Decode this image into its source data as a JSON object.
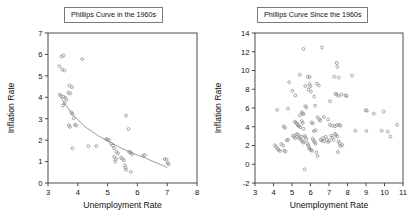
{
  "figure": {
    "background": "#ffffff",
    "marker_color": "#8a8a8a",
    "axis_color": "#3a3a3a",
    "curve_color": "#8a8a8a"
  },
  "panels": [
    {
      "id": "left",
      "title": "Phillips Curve in the 1960s",
      "chart_data": {
        "type": "scatter",
        "title": "Phillips Curve in the 1960s",
        "xlabel": "Unemployment Rate",
        "ylabel": "Inflation Rate",
        "xlim": [
          3,
          8
        ],
        "ylim": [
          0,
          7
        ],
        "xticks": [
          3,
          4,
          5,
          6,
          7,
          8
        ],
        "yticks": [
          0,
          1,
          2,
          3,
          4,
          5,
          6,
          7
        ],
        "grid": false,
        "legend": "none",
        "marker": "open-circle",
        "points": [
          [
            3.45,
            5.9
          ],
          [
            3.52,
            5.95
          ],
          [
            3.38,
            5.45
          ],
          [
            3.48,
            5.3
          ],
          [
            3.55,
            5.25
          ],
          [
            4.15,
            5.78
          ],
          [
            3.72,
            4.55
          ],
          [
            3.8,
            4.48
          ],
          [
            3.68,
            4.22
          ],
          [
            3.75,
            4.18
          ],
          [
            3.4,
            4.12
          ],
          [
            3.44,
            4.05
          ],
          [
            3.52,
            4.02
          ],
          [
            3.58,
            3.98
          ],
          [
            3.62,
            3.88
          ],
          [
            3.55,
            3.72
          ],
          [
            3.5,
            3.62
          ],
          [
            3.78,
            3.3
          ],
          [
            3.82,
            3.22
          ],
          [
            3.86,
            3.02
          ],
          [
            3.7,
            2.7
          ],
          [
            3.74,
            2.62
          ],
          [
            3.9,
            2.72
          ],
          [
            3.95,
            2.68
          ],
          [
            3.82,
            1.62
          ],
          [
            4.35,
            1.72
          ],
          [
            4.62,
            1.72
          ],
          [
            4.95,
            2.05
          ],
          [
            5.0,
            2.02
          ],
          [
            5.05,
            1.98
          ],
          [
            5.12,
            1.82
          ],
          [
            5.18,
            1.75
          ],
          [
            5.22,
            1.62
          ],
          [
            5.3,
            1.45
          ],
          [
            5.35,
            1.38
          ],
          [
            5.22,
            1.22
          ],
          [
            5.28,
            1.12
          ],
          [
            5.25,
            1.0
          ],
          [
            5.45,
            1.18
          ],
          [
            5.5,
            1.12
          ],
          [
            5.55,
            1.05
          ],
          [
            5.58,
            0.82
          ],
          [
            5.6,
            0.72
          ],
          [
            5.62,
            0.62
          ],
          [
            5.72,
            1.45
          ],
          [
            5.78,
            1.42
          ],
          [
            5.82,
            1.35
          ],
          [
            5.78,
            0.52
          ],
          [
            5.62,
            3.15
          ],
          [
            5.7,
            2.52
          ],
          [
            6.18,
            1.28
          ],
          [
            6.25,
            1.3
          ],
          [
            6.92,
            1.12
          ],
          [
            6.98,
            1.08
          ],
          [
            7.02,
            0.92
          ],
          [
            7.05,
            0.88
          ]
        ],
        "fit_curve": {
          "label": "fitted Phillips curve",
          "points": [
            [
              3.45,
              3.95
            ],
            [
              3.6,
              3.62
            ],
            [
              3.8,
              3.25
            ],
            [
              4.0,
              2.95
            ],
            [
              4.25,
              2.62
            ],
            [
              4.5,
              2.38
            ],
            [
              4.75,
              2.15
            ],
            [
              5.0,
              1.98
            ],
            [
              5.25,
              1.78
            ],
            [
              5.5,
              1.6
            ],
            [
              5.75,
              1.45
            ],
            [
              6.0,
              1.3
            ],
            [
              6.25,
              1.18
            ],
            [
              6.5,
              1.02
            ],
            [
              6.75,
              0.88
            ],
            [
              7.0,
              0.72
            ]
          ]
        }
      }
    },
    {
      "id": "right",
      "title": "Phillips Curve Since the 1960s",
      "chart_data": {
        "type": "scatter",
        "title": "Phillips Curve Since the 1960s",
        "xlabel": "Unemployment Rate",
        "ylabel": "Inflation Rate",
        "xlim": [
          3,
          11
        ],
        "ylim": [
          -2,
          14
        ],
        "xticks": [
          3,
          4,
          5,
          6,
          7,
          8,
          9,
          10,
          11
        ],
        "yticks": [
          -2,
          0,
          2,
          4,
          6,
          8,
          10,
          12,
          14
        ],
        "grid": false,
        "legend": "none",
        "marker": "open-circle",
        "points": [
          [
            5.62,
            12.3
          ],
          [
            6.62,
            12.45
          ],
          [
            7.42,
            10.8
          ],
          [
            7.45,
            10.4
          ],
          [
            5.42,
            9.55
          ],
          [
            5.85,
            9.35
          ],
          [
            5.95,
            9.3
          ],
          [
            7.28,
            9.35
          ],
          [
            7.52,
            9.25
          ],
          [
            8.25,
            9.45
          ],
          [
            4.85,
            8.75
          ],
          [
            5.72,
            8.35
          ],
          [
            5.95,
            8.55
          ],
          [
            5.98,
            8.3
          ],
          [
            6.45,
            8.4
          ],
          [
            6.35,
            8.6
          ],
          [
            5.02,
            7.82
          ],
          [
            5.18,
            7.35
          ],
          [
            5.9,
            7.95
          ],
          [
            6.02,
            7.75
          ],
          [
            7.35,
            7.52
          ],
          [
            7.42,
            7.45
          ],
          [
            7.52,
            7.3
          ],
          [
            7.68,
            7.42
          ],
          [
            7.9,
            7.35
          ],
          [
            7.95,
            7.28
          ],
          [
            7.05,
            6.72
          ],
          [
            6.2,
            7.22
          ],
          [
            6.25,
            6.25
          ],
          [
            4.2,
            5.8
          ],
          [
            4.78,
            5.95
          ],
          [
            5.52,
            5.55
          ],
          [
            5.58,
            5.42
          ],
          [
            5.62,
            5.35
          ],
          [
            5.72,
            6.2
          ],
          [
            5.78,
            6.05
          ],
          [
            5.42,
            5.2
          ],
          [
            6.38,
            5.02
          ],
          [
            6.48,
            4.82
          ],
          [
            6.52,
            4.65
          ],
          [
            6.72,
            5.05
          ],
          [
            6.95,
            4.78
          ],
          [
            8.98,
            5.75
          ],
          [
            9.05,
            5.72
          ],
          [
            9.42,
            5.4
          ],
          [
            9.95,
            5.62
          ],
          [
            4.55,
            4.05
          ],
          [
            4.62,
            3.88
          ],
          [
            5.15,
            4.55
          ],
          [
            5.22,
            4.42
          ],
          [
            5.28,
            4.3
          ],
          [
            5.32,
            4.15
          ],
          [
            5.38,
            4.08
          ],
          [
            5.45,
            3.95
          ],
          [
            5.52,
            4.6
          ],
          [
            5.58,
            4.4
          ],
          [
            5.62,
            3.78
          ],
          [
            6.05,
            4.45
          ],
          [
            6.12,
            4.35
          ],
          [
            6.18,
            3.55
          ],
          [
            6.28,
            3.62
          ],
          [
            7.05,
            4.2
          ],
          [
            7.18,
            4.12
          ],
          [
            7.32,
            4.05
          ],
          [
            7.42,
            4.18
          ],
          [
            7.55,
            4.22
          ],
          [
            7.62,
            4.1
          ],
          [
            8.42,
            3.58
          ],
          [
            9.02,
            3.55
          ],
          [
            9.85,
            3.58
          ],
          [
            10.18,
            3.48
          ],
          [
            10.68,
            4.22
          ],
          [
            4.08,
            2.02
          ],
          [
            4.15,
            1.85
          ],
          [
            4.22,
            1.65
          ],
          [
            4.28,
            1.52
          ],
          [
            4.35,
            1.42
          ],
          [
            4.42,
            2.15
          ],
          [
            4.52,
            1.98
          ],
          [
            4.58,
            1.45
          ],
          [
            4.65,
            1.35
          ],
          [
            4.72,
            2.55
          ],
          [
            4.78,
            2.62
          ],
          [
            5.05,
            3.05
          ],
          [
            5.12,
            2.92
          ],
          [
            5.18,
            2.78
          ],
          [
            5.25,
            3.22
          ],
          [
            5.32,
            3.15
          ],
          [
            5.38,
            2.85
          ],
          [
            5.42,
            2.72
          ],
          [
            5.48,
            2.95
          ],
          [
            5.52,
            2.55
          ],
          [
            5.58,
            2.42
          ],
          [
            5.62,
            2.32
          ],
          [
            5.68,
            3.02
          ],
          [
            5.72,
            2.88
          ],
          [
            5.78,
            2.65
          ],
          [
            5.82,
            2.22
          ],
          [
            5.88,
            2.05
          ],
          [
            5.92,
            1.82
          ],
          [
            5.95,
            1.62
          ],
          [
            6.02,
            1.52
          ],
          [
            6.08,
            1.45
          ],
          [
            6.12,
            2.72
          ],
          [
            6.18,
            2.52
          ],
          [
            6.22,
            2.35
          ],
          [
            6.28,
            2.18
          ],
          [
            6.32,
            1.28
          ],
          [
            6.38,
            0.88
          ],
          [
            6.55,
            2.62
          ],
          [
            6.62,
            2.52
          ],
          [
            6.68,
            2.78
          ],
          [
            6.72,
            2.45
          ],
          [
            6.82,
            2.92
          ],
          [
            6.88,
            2.62
          ],
          [
            6.95,
            2.38
          ],
          [
            7.02,
            2.52
          ],
          [
            7.12,
            3.05
          ],
          [
            7.18,
            2.85
          ],
          [
            7.25,
            2.62
          ],
          [
            7.32,
            3.25
          ],
          [
            7.38,
            3.12
          ],
          [
            7.45,
            2.95
          ],
          [
            7.52,
            2.42
          ],
          [
            7.58,
            2.22
          ],
          [
            7.62,
            1.95
          ],
          [
            7.72,
            2.05
          ],
          [
            7.48,
            1.3
          ],
          [
            5.68,
            -0.55
          ],
          [
            10.32,
            2.95
          ]
        ]
      }
    }
  ]
}
